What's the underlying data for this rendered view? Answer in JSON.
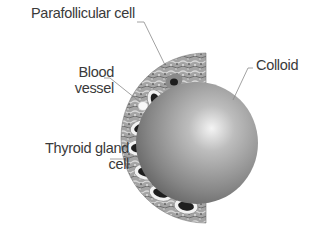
{
  "diagram": {
    "labels": {
      "parafollicular": "Parafollicular cell",
      "blood_vessel": "Blood\nvessel",
      "blood_vessel_line1": "Blood",
      "blood_vessel_line2": "vessel",
      "thyroid_cell_line1": "Thyroid gland",
      "thyroid_cell_line2": "cell",
      "colloid": "Colloid"
    },
    "colors": {
      "background": "#ffffff",
      "label_text": "#3a3a3a",
      "leader_line": "#8a8a8a",
      "tissue_band": "#9a9a9a",
      "colloid_light": "#e6e6e6",
      "colloid_dark": "#5e5e5e",
      "cell_ring": "#f2f2f2",
      "nucleus": "#1e1e1e"
    },
    "components": [
      {
        "name": "colloid",
        "shape": "sphere"
      },
      {
        "name": "follicular epithelium",
        "shape": "half-ring band"
      },
      {
        "name": "thyroid gland cells",
        "count": 7
      },
      {
        "name": "parafollicular cell",
        "count": 1
      },
      {
        "name": "blood vessel",
        "count": 1
      }
    ]
  }
}
